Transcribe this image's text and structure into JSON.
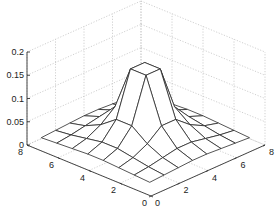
{
  "chart_data": {
    "type": "surface-mesh",
    "title": "",
    "xlabel": "",
    "ylabel": "",
    "zlabel": "",
    "grid": true,
    "z_ticks": [
      "0",
      "0.05",
      "0.1",
      "0.15",
      "0.2"
    ],
    "z_tick_values": [
      0,
      0.05,
      0.1,
      0.15,
      0.2
    ],
    "zlim": [
      0,
      0.2
    ],
    "left_axis_ticks": [
      "0",
      "2",
      "4",
      "6",
      "8"
    ],
    "left_axis_tick_values": [
      0,
      2,
      4,
      6,
      8
    ],
    "right_axis_ticks": [
      "0",
      "2",
      "4",
      "6",
      "8"
    ],
    "right_axis_tick_values": [
      0,
      2,
      4,
      6,
      8
    ],
    "xlim": [
      0,
      8
    ],
    "ylim": [
      0,
      8
    ],
    "grid_coords": [
      1,
      2,
      3,
      4,
      5,
      6,
      7,
      8
    ],
    "z": [
      [
        0.002,
        0.004,
        0.006,
        0.008,
        0.008,
        0.006,
        0.004,
        0.002
      ],
      [
        0.004,
        0.008,
        0.014,
        0.02,
        0.02,
        0.014,
        0.008,
        0.004
      ],
      [
        0.006,
        0.014,
        0.03,
        0.055,
        0.055,
        0.03,
        0.014,
        0.006
      ],
      [
        0.008,
        0.02,
        0.055,
        0.15,
        0.15,
        0.055,
        0.02,
        0.008
      ],
      [
        0.008,
        0.02,
        0.055,
        0.15,
        0.15,
        0.055,
        0.02,
        0.008
      ],
      [
        0.006,
        0.014,
        0.03,
        0.055,
        0.055,
        0.03,
        0.014,
        0.006
      ],
      [
        0.004,
        0.008,
        0.014,
        0.02,
        0.02,
        0.014,
        0.008,
        0.004
      ],
      [
        0.002,
        0.004,
        0.006,
        0.008,
        0.008,
        0.006,
        0.004,
        0.002
      ]
    ],
    "peak_value": 0.15,
    "colors": {
      "mesh": "#2a2a2a",
      "axis": "#333333",
      "grid": "#bbbbbb",
      "background": "#ffffff"
    }
  }
}
